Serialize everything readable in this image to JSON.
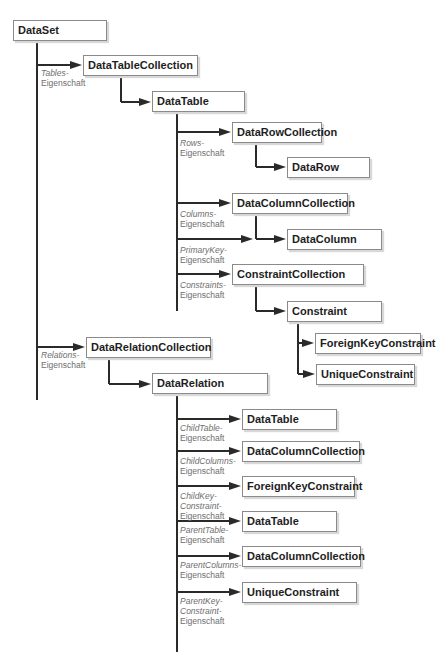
{
  "diagram": {
    "colors": {
      "line": "#2a2a2a",
      "border": "#8a8a8a",
      "label": "#6e6e6e",
      "text": "#1e1e1e"
    },
    "nodes": [
      {
        "id": "dataset",
        "label": "DataSet",
        "x": 13,
        "y": 20,
        "w": 94
      },
      {
        "id": "datatablecollection",
        "label": "DataTableCollection",
        "x": 83,
        "y": 55,
        "w": 115
      },
      {
        "id": "datatable",
        "label": "DataTable",
        "x": 152,
        "y": 91,
        "w": 93
      },
      {
        "id": "datarowcollection",
        "label": "DataRowCollection",
        "x": 232,
        "y": 122,
        "w": 90
      },
      {
        "id": "datarow",
        "label": "DataRow",
        "x": 287,
        "y": 157,
        "w": 83
      },
      {
        "id": "datacolumncollection",
        "label": "DataColumnCollection",
        "x": 232,
        "y": 193,
        "w": 116
      },
      {
        "id": "datacolumn",
        "label": "DataColumn",
        "x": 287,
        "y": 229,
        "w": 95
      },
      {
        "id": "constraintcollection",
        "label": "ConstraintCollection",
        "x": 232,
        "y": 264,
        "w": 132
      },
      {
        "id": "constraint",
        "label": "Constraint",
        "x": 287,
        "y": 301,
        "w": 95
      },
      {
        "id": "foreignkeyconstraint",
        "label": "ForeignKeyConstraint",
        "x": 315,
        "y": 333,
        "w": 106
      },
      {
        "id": "uniqueconstraint",
        "label": "UniqueConstraint",
        "x": 316,
        "y": 364,
        "w": 99
      },
      {
        "id": "datarelationcollection",
        "label": "DataRelationCollection",
        "x": 86,
        "y": 337,
        "w": 125
      },
      {
        "id": "datarelation",
        "label": "DataRelation",
        "x": 152,
        "y": 373,
        "w": 116
      },
      {
        "id": "rel-childtable",
        "label": "DataTable",
        "x": 242,
        "y": 409,
        "w": 95
      },
      {
        "id": "rel-childcolumns",
        "label": "DataColumnCollection",
        "x": 242,
        "y": 441,
        "w": 118
      },
      {
        "id": "rel-childkeyconstraint",
        "label": "ForeignKeyConstraint",
        "x": 242,
        "y": 476,
        "w": 113
      },
      {
        "id": "rel-parenttable",
        "label": "DataTable",
        "x": 242,
        "y": 511,
        "w": 95
      },
      {
        "id": "rel-parentcolumns",
        "label": "DataColumnCollection",
        "x": 242,
        "y": 546,
        "w": 119
      },
      {
        "id": "rel-parentkeyconstraint",
        "label": "UniqueConstraint",
        "x": 242,
        "y": 582,
        "w": 115
      }
    ],
    "labels": [
      {
        "id": "tables-prop",
        "prop": "Tables-",
        "suffix": "Eigenschaft",
        "x": 41,
        "y": 68
      },
      {
        "id": "rows-prop",
        "prop": "Rows-",
        "suffix": "Eigenschaft",
        "x": 180,
        "y": 138
      },
      {
        "id": "columns-prop",
        "prop": "Columns-",
        "suffix": "Eigenschaft",
        "x": 180,
        "y": 209
      },
      {
        "id": "primarykey-prop",
        "prop": "PrimaryKey-",
        "suffix": "Eigenschaft",
        "x": 180,
        "y": 245
      },
      {
        "id": "constraints-prop",
        "prop": "Constraints-",
        "suffix": "Eigenschaft",
        "x": 180,
        "y": 280
      },
      {
        "id": "relations-prop",
        "prop": "Relations-",
        "suffix": "Eigenschaft",
        "x": 41,
        "y": 350
      },
      {
        "id": "childtable-prop",
        "prop": "ChildTable-",
        "suffix": "Eigenschaft",
        "x": 180,
        "y": 423
      },
      {
        "id": "childcolumns-prop",
        "prop": "ChildColumns-",
        "suffix": "Eigenschaft",
        "x": 180,
        "y": 456
      },
      {
        "id": "childkeyconstraint-prop",
        "prop": "ChildKey-",
        "prop2": "Constraint-",
        "suffix": "Eigenschaft",
        "x": 180,
        "y": 491
      },
      {
        "id": "parenttable-prop",
        "prop": "ParentTable-",
        "suffix": "Eigenschaft",
        "x": 180,
        "y": 525
      },
      {
        "id": "parentcolumns-prop",
        "prop": "ParentColumns-",
        "suffix": "Eigenschaft",
        "x": 180,
        "y": 560
      },
      {
        "id": "parentkeyconstraint-prop",
        "prop": "ParentKey-",
        "prop2": "Constraint-",
        "suffix": "Eigenschaft",
        "x": 180,
        "y": 596
      }
    ],
    "vlines": [
      {
        "x": 37,
        "y1": 40,
        "y2": 400
      },
      {
        "x": 121,
        "y1": 75,
        "y2": 102
      },
      {
        "x": 177,
        "y1": 111,
        "y2": 311
      },
      {
        "x": 256,
        "y1": 143,
        "y2": 167
      },
      {
        "x": 256,
        "y1": 214,
        "y2": 239
      },
      {
        "x": 256,
        "y1": 285,
        "y2": 311
      },
      {
        "x": 298,
        "y1": 322,
        "y2": 374
      },
      {
        "x": 109,
        "y1": 358,
        "y2": 384
      },
      {
        "x": 177,
        "y1": 394,
        "y2": 652
      }
    ],
    "arrows": [
      {
        "x1": 37,
        "x2": 83,
        "y": 65
      },
      {
        "x1": 121,
        "x2": 152,
        "y": 102
      },
      {
        "x1": 177,
        "x2": 232,
        "y": 132
      },
      {
        "x1": 256,
        "x2": 287,
        "y": 167
      },
      {
        "x1": 177,
        "x2": 232,
        "y": 203
      },
      {
        "x1": 177,
        "x2": 254,
        "y": 239
      },
      {
        "x1": 256,
        "x2": 287,
        "y": 239
      },
      {
        "x1": 177,
        "x2": 232,
        "y": 274
      },
      {
        "x1": 256,
        "x2": 287,
        "y": 311
      },
      {
        "x1": 298,
        "x2": 315,
        "y": 343
      },
      {
        "x1": 298,
        "x2": 316,
        "y": 374
      },
      {
        "x1": 37,
        "x2": 86,
        "y": 347
      },
      {
        "x1": 109,
        "x2": 152,
        "y": 384
      },
      {
        "x1": 177,
        "x2": 242,
        "y": 419
      },
      {
        "x1": 177,
        "x2": 242,
        "y": 451
      },
      {
        "x1": 177,
        "x2": 242,
        "y": 486
      },
      {
        "x1": 177,
        "x2": 242,
        "y": 521
      },
      {
        "x1": 177,
        "x2": 242,
        "y": 556
      },
      {
        "x1": 177,
        "x2": 242,
        "y": 592
      }
    ]
  }
}
